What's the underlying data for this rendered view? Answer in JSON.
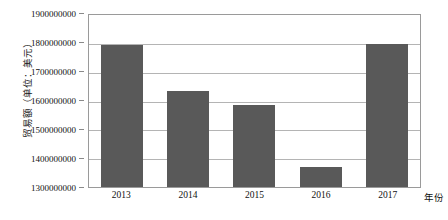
{
  "chart_data": {
    "type": "bar",
    "title": "",
    "subtitle": "",
    "xlabel": "年份",
    "ylabel": "贸易额（单位：美元）",
    "categories": [
      "2013",
      "2014",
      "2015",
      "2016",
      "2017"
    ],
    "values": [
      1795000000,
      1635000000,
      1585000000,
      1369000000,
      1800000000
    ],
    "series": [
      {
        "name": "贸易额",
        "values": [
          1795000000,
          1635000000,
          1585000000,
          1369000000,
          1800000000
        ]
      }
    ],
    "ylim": [
      1300000000,
      1900000000
    ],
    "yticks": [
      1300000000,
      1400000000,
      1500000000,
      1600000000,
      1700000000,
      1800000000,
      1900000000
    ],
    "ytick_labels": [
      "1300000000",
      "1400000000",
      "1500000000",
      "1600000000",
      "1700000000",
      "1800000000",
      "1900000000"
    ],
    "grid": true,
    "legend": false,
    "legend_position": "none",
    "bar_color": "#595959",
    "gridline_color": "#b4b4b4",
    "frame_color": "#9a9a9a",
    "background_color": "#ffffff"
  }
}
